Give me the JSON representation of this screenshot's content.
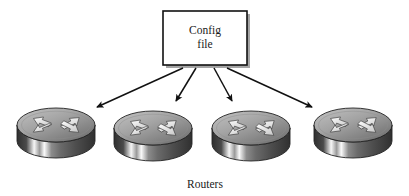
{
  "figure": {
    "title_box": {
      "line1": "Config",
      "line2": "file",
      "fill": "#ffffff",
      "stroke": "#000000"
    },
    "caption": "Routers",
    "arrow_color": "#111111",
    "arrow_count": 4,
    "nodes": [
      {
        "label": "Router 1",
        "icon": "router-icon"
      },
      {
        "label": "Router 2",
        "icon": "router-icon"
      },
      {
        "label": "Router 3",
        "icon": "router-icon"
      },
      {
        "label": "Router 4",
        "icon": "router-icon"
      }
    ],
    "colors": {
      "router_top_light": "#b9b9b9",
      "router_top_dark": "#7e7e7e",
      "router_side_dark": "#3d3d3d",
      "router_side_light": "#f2f2f2",
      "outline": "#2b2b2b",
      "background": "#ffffff"
    }
  }
}
